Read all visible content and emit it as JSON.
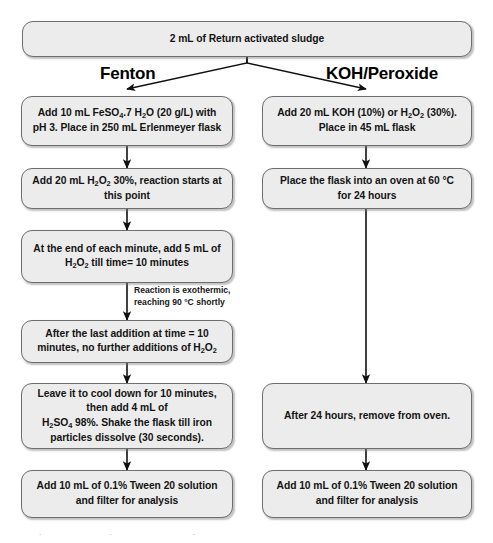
{
  "figure": {
    "box_fill": "#ececec",
    "box_border": "#6e6e6e",
    "arrow_color": "#111111",
    "page_background": "#ffffff"
  },
  "start": {
    "label": "2 mL of Return activated sludge"
  },
  "branches": [
    {
      "name": "fenton",
      "heading": "Fenton"
    },
    {
      "name": "koh_peroxide",
      "heading": "KOH/Peroxide"
    }
  ],
  "left_column": {
    "heading": "Fenton",
    "steps": [
      {
        "id": "L1",
        "text_plain": "Add 10 mL FeSO4.7 H2O (20 g/L) with pH 3. Place in 250 mL Erlenmeyer flask",
        "lines": [
          "Add 10 mL FeSO<sub>4</sub>.7 H<sub>2</sub>O (20 g/L) with",
          "pH 3. Place in 250 mL Erlenmeyer flask"
        ]
      },
      {
        "id": "L2",
        "text_plain": "Add 20 mL H2O2 30%, reaction starts at this point",
        "lines": [
          "Add 20 mL H<sub>2</sub>O<sub>2</sub> 30%, reaction starts at",
          "this point"
        ]
      },
      {
        "id": "L3",
        "text_plain": "At the end of each minute, add 5 mL of H2O2 till time= 10 minutes",
        "lines": [
          "At the end of each minute, add 5 mL of",
          "H<sub>2</sub>O<sub>2</sub> till time= 10 minutes"
        ]
      },
      {
        "id": "L4",
        "text_plain": "After the last addition at time = 10 minutes, no further additions of H2O2",
        "lines": [
          "After the last addition at time = 10",
          "minutes, no further additions of H<sub>2</sub>O<sub>2</sub>"
        ]
      },
      {
        "id": "L5",
        "text_plain": "Leave it to cool down for 10 minutes, then add 4 mL of H2SO4 98%. Shake the flask till iron particles dissolve (30 seconds).",
        "lines": [
          "Leave it to cool down for 10 minutes,",
          "then add 4 mL of",
          "H<sub>2</sub>SO<sub>4</sub> 98%. Shake the flask till iron",
          "particles dissolve (30 seconds)."
        ]
      },
      {
        "id": "L6",
        "text_plain": "Add 10 mL of 0.1% Tween 20 solution and filter for analysis",
        "lines": [
          "Add 10 mL of 0.1% Tween 20 solution",
          "and filter for analysis"
        ]
      }
    ],
    "annotation": {
      "id": "A1",
      "text_plain": "Reaction is exothermic, reaching 90 °C shortly",
      "lines": [
        "Reaction is exothermic,",
        "reaching 90 °C shortly"
      ]
    }
  },
  "right_column": {
    "heading": "KOH/Peroxide",
    "steps": [
      {
        "id": "R1",
        "text_plain": "Add 20 mL KOH (10%) or H2O2 (30%). Place in 45 mL flask",
        "lines": [
          "Add 20 mL  KOH (10%) or H<sub>2</sub>O<sub>2</sub> (30%).",
          "Place in 45 mL flask"
        ]
      },
      {
        "id": "R2",
        "text_plain": "Place the flask into an oven at 60 °C for 24 hours",
        "lines": [
          "Place the flask into an oven at 60 °C",
          "for 24 hours"
        ]
      },
      {
        "id": "R3",
        "text_plain": "After 24 hours, remove from oven.",
        "lines": [
          "After 24 hours, remove from oven."
        ]
      },
      {
        "id": "R4",
        "text_plain": "Add 10 mL of 0.1% Tween 20 solution and filter for analysis",
        "lines": [
          "Add 10 mL of 0.1% Tween 20 solution",
          "and filter for analysis"
        ]
      }
    ]
  },
  "caption": {
    "cropped_text": "the KOH/peroxide method. Reproduced with the Famdly"
  }
}
